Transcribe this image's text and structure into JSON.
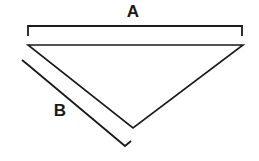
{
  "diagram": {
    "background_color": "#ffffff",
    "stroke_color": "#1a1a1a",
    "label_color": "#1a1a1a",
    "shape": {
      "name": "downward-pointing-triangle",
      "vertices": [
        {
          "name": "top-left",
          "x": 28,
          "y": 45
        },
        {
          "name": "top-right",
          "x": 243,
          "y": 45
        },
        {
          "name": "bottom",
          "x": 133,
          "y": 128
        }
      ],
      "points_path": "28,45 243,45 133,128",
      "stroke_width": 1.6
    },
    "dimension_a": {
      "label": "A",
      "label_x": 133,
      "label_y": 13,
      "measures_edge": "top-edge",
      "bracket_path": "M 28 36 L 28 26 L 242 26 L 242 36",
      "stroke_width": 1.8
    },
    "dimension_b": {
      "label": "B",
      "label_x": 60,
      "label_y": 112,
      "measures_edge": "left-edge",
      "bracket_path": "M 22 60 L 27 64 L 125 146 L 131 141",
      "stroke_width": 1.8
    }
  }
}
